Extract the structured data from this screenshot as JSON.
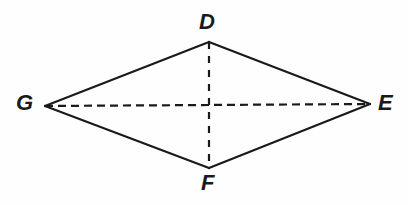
{
  "figure": {
    "name": "rhombus-degf",
    "background_color": "#fefefe",
    "stroke_color": "#1a1a1a",
    "solid_stroke_width": 2.2,
    "dashed_stroke_width": 2.2,
    "width": 408,
    "height": 205,
    "vertices": [
      {
        "id": "D",
        "label": "D",
        "x": 209,
        "y": 42,
        "label_x": 207,
        "label_y": 23,
        "position": "top"
      },
      {
        "id": "E",
        "label": "E",
        "x": 370,
        "y": 104,
        "label_x": 386,
        "label_y": 103,
        "position": "right"
      },
      {
        "id": "F",
        "label": "F",
        "x": 209,
        "y": 168,
        "label_x": 208,
        "label_y": 184,
        "position": "bottom"
      },
      {
        "id": "G",
        "label": "G",
        "x": 45,
        "y": 106,
        "label_x": 25,
        "label_y": 103,
        "position": "left"
      }
    ],
    "edges": [
      {
        "name": "edge-GD",
        "from": "G",
        "to": "D",
        "style": "solid"
      },
      {
        "name": "edge-DE",
        "from": "D",
        "to": "E",
        "style": "solid"
      },
      {
        "name": "edge-EF",
        "from": "E",
        "to": "F",
        "style": "solid"
      },
      {
        "name": "edge-FG",
        "from": "F",
        "to": "G",
        "style": "solid"
      }
    ],
    "diagonals": [
      {
        "name": "diagonal-GE",
        "from": "G",
        "to": "E",
        "style": "dashed",
        "dash_pattern": "8 5",
        "orientation": "horizontal"
      },
      {
        "name": "diagonal-DF",
        "from": "D",
        "to": "F",
        "style": "dashed",
        "dash_pattern": "7 7",
        "orientation": "vertical"
      }
    ]
  }
}
